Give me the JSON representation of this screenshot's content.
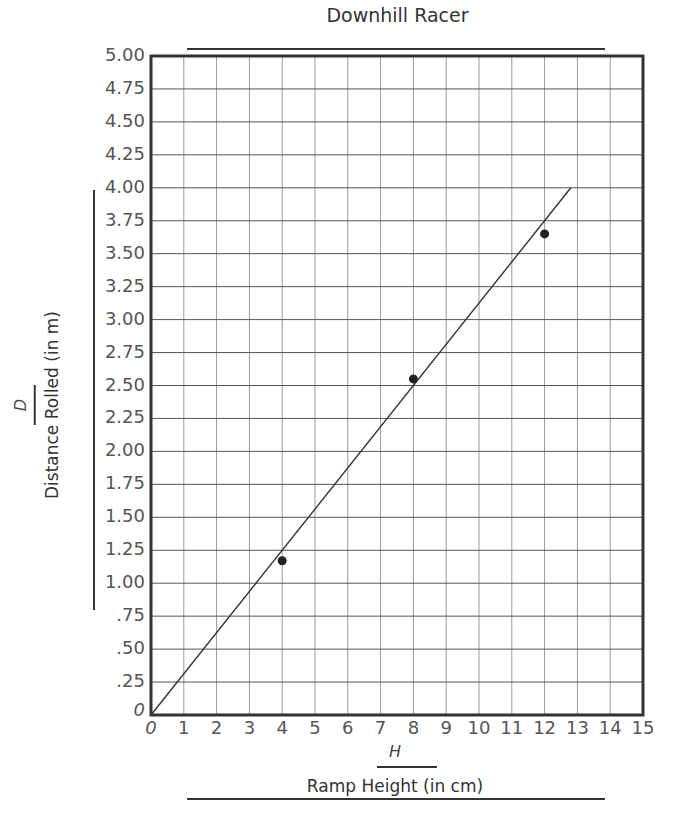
{
  "chart_data": {
    "type": "scatter",
    "title": "Downhill Racer",
    "xlabel": "Ramp Height (in cm)",
    "xvar": "H",
    "ylabel": "Distance Rolled (in m)",
    "yvar": "D",
    "xlim": [
      0,
      15
    ],
    "ylim": [
      0,
      5.0
    ],
    "grid": true,
    "x_ticks": [
      "0",
      "1",
      "2",
      "3",
      "4",
      "5",
      "6",
      "7",
      "8",
      "9",
      "10",
      "11",
      "12",
      "13",
      "14",
      "15"
    ],
    "y_ticks": [
      "0",
      ".25",
      ".50",
      ".75",
      "1.00",
      "1.25",
      "1.50",
      "1.75",
      "2.00",
      "2.25",
      "2.50",
      "2.75",
      "3.00",
      "3.25",
      "3.50",
      "3.75",
      "4.00",
      "4.25",
      "4.50",
      "4.75",
      "5.00"
    ],
    "series": [
      {
        "name": "Measured",
        "type": "scatter",
        "x": [
          4,
          8,
          12
        ],
        "y": [
          1.17,
          2.55,
          3.65
        ]
      },
      {
        "name": "Best-fit line",
        "type": "line",
        "x": [
          0,
          12.8
        ],
        "y": [
          0,
          4.0
        ]
      }
    ]
  }
}
